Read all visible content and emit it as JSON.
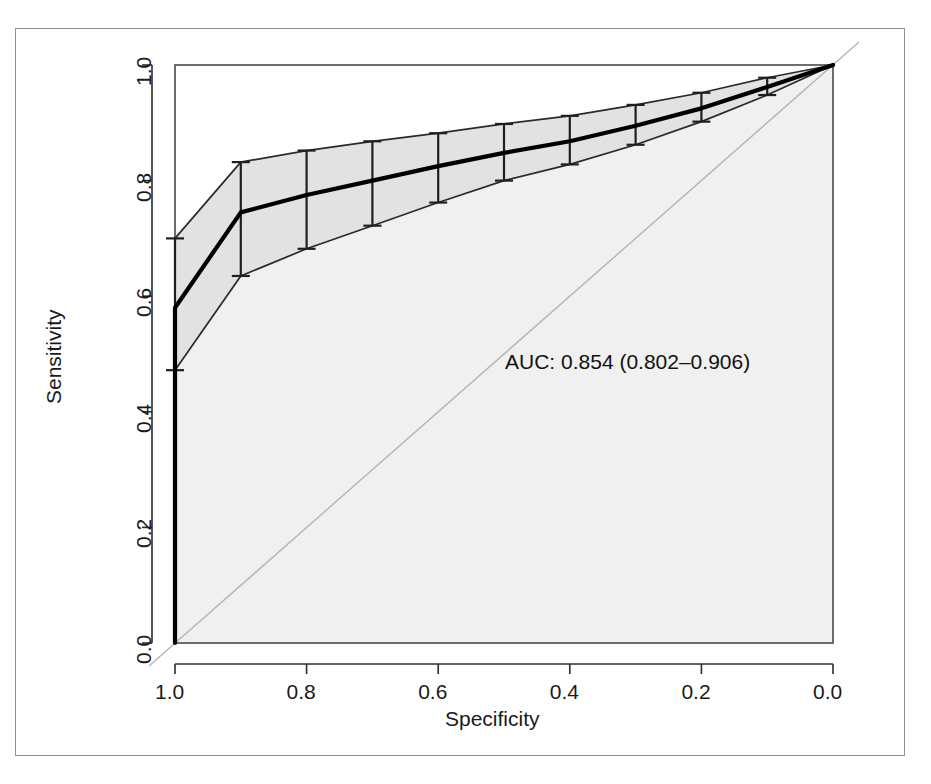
{
  "figure": {
    "kind": "roc-curve-plot",
    "background": "#ffffff",
    "frame_color": "#8d8d8d"
  },
  "annotation": {
    "auc_text": "AUC: 0.854 (0.802–0.906)"
  },
  "axes": {
    "x_title": "Specificity",
    "y_title": "Sensitivity",
    "x_ticks": [
      "1.0",
      "0.8",
      "0.6",
      "0.4",
      "0.2",
      "0.0"
    ],
    "y_ticks": [
      "0.0",
      "0.2",
      "0.4",
      "0.6",
      "0.8",
      "1.0"
    ]
  },
  "chart_data": {
    "type": "line",
    "title": "",
    "xlabel": "Specificity",
    "ylabel": "Sensitivity",
    "xlim": [
      1.0,
      0.0
    ],
    "ylim": [
      0.0,
      1.0
    ],
    "x_reversed": true,
    "grid": false,
    "legend": null,
    "auc": 0.854,
    "auc_ci_lower": 0.802,
    "auc_ci_upper": 0.906,
    "auc_label": "AUC: 0.854 (0.802–0.906)",
    "colors": {
      "curve": "#000000",
      "ci_band_fill": "#e2e2e2",
      "ci_band_edge": "#2a2a2a",
      "auc_fill": "#f0f0f0",
      "chance_line": "#b0b0b0",
      "axis": "#1a1a1a"
    },
    "series": [
      {
        "name": "ROC curve",
        "specificity": [
          1.0,
          1.0,
          0.9,
          0.8,
          0.7,
          0.6,
          0.5,
          0.4,
          0.3,
          0.2,
          0.1,
          0.0
        ],
        "sensitivity": [
          0.0,
          0.58,
          0.745,
          0.775,
          0.8,
          0.825,
          0.848,
          0.868,
          0.895,
          0.925,
          0.962,
          1.0
        ]
      },
      {
        "name": "CI upper bound",
        "specificity": [
          1.0,
          0.9,
          0.8,
          0.7,
          0.6,
          0.5,
          0.4,
          0.3,
          0.2,
          0.1,
          0.0
        ],
        "sensitivity": [
          0.7,
          0.832,
          0.852,
          0.868,
          0.882,
          0.898,
          0.912,
          0.931,
          0.952,
          0.978,
          1.0
        ]
      },
      {
        "name": "CI lower bound",
        "specificity": [
          1.0,
          0.9,
          0.8,
          0.7,
          0.6,
          0.5,
          0.4,
          0.3,
          0.2,
          0.1,
          0.0
        ],
        "sensitivity": [
          0.472,
          0.635,
          0.682,
          0.722,
          0.762,
          0.8,
          0.828,
          0.862,
          0.902,
          0.948,
          1.0
        ]
      },
      {
        "name": "Chance line",
        "specificity": [
          1.0,
          0.0
        ],
        "sensitivity": [
          0.0,
          1.0
        ]
      }
    ],
    "error_bars": [
      {
        "specificity": 1.0,
        "point": 0.58,
        "low": 0.472,
        "high": 0.7
      },
      {
        "specificity": 0.9,
        "point": 0.745,
        "low": 0.635,
        "high": 0.832
      },
      {
        "specificity": 0.8,
        "point": 0.775,
        "low": 0.682,
        "high": 0.852
      },
      {
        "specificity": 0.7,
        "point": 0.8,
        "low": 0.722,
        "high": 0.868
      },
      {
        "specificity": 0.6,
        "point": 0.825,
        "low": 0.762,
        "high": 0.882
      },
      {
        "specificity": 0.5,
        "point": 0.848,
        "low": 0.8,
        "high": 0.898
      },
      {
        "specificity": 0.4,
        "point": 0.868,
        "low": 0.828,
        "high": 0.912
      },
      {
        "specificity": 0.3,
        "point": 0.895,
        "low": 0.862,
        "high": 0.931
      },
      {
        "specificity": 0.2,
        "point": 0.925,
        "low": 0.902,
        "high": 0.952
      },
      {
        "specificity": 0.1,
        "point": 0.962,
        "low": 0.948,
        "high": 0.978
      }
    ]
  }
}
